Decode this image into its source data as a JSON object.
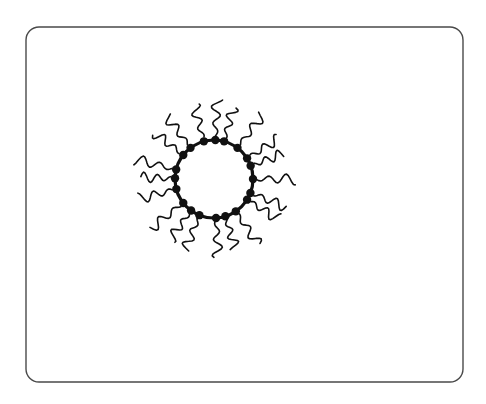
{
  "figure": {
    "kind": "scientific-line-diagram",
    "title": "",
    "caption": "",
    "background_color": "#ffffff",
    "ink_color": "#111111"
  },
  "frame": {
    "name": "rounded-rectangle-border",
    "x": 26,
    "y": 27,
    "width": 437,
    "height": 355,
    "corner_radius": 13,
    "stroke_color": "#4a4a4a",
    "stroke_width": 1.4,
    "fill": "#ffffff"
  },
  "micelle": {
    "center_x": 214,
    "center_y": 179,
    "core": {
      "name": "hydrophilic-core-ring",
      "radius": 39,
      "stroke_color": "#111111",
      "stroke_width": 3.2,
      "fill": "#ffffff"
    },
    "head_groups": {
      "name": "surfactant-head-group",
      "count": 20,
      "radius": 4.2,
      "orbit_radius": 39,
      "fill_color": "#111111",
      "shape": "filled-circle"
    },
    "tails": {
      "name": "surfactant-hydrocarbon-tail",
      "count": 20,
      "length": 33,
      "stroke_color": "#111111",
      "stroke_width": 1.6,
      "style": "wavy-radial",
      "wave_amplitude": 4.5,
      "wave_count": 2.2
    },
    "angles_deg": [
      0,
      18,
      36,
      54,
      72,
      90,
      108,
      126,
      144,
      162,
      180,
      198,
      216,
      234,
      252,
      270,
      288,
      306,
      324,
      342
    ],
    "tail_length_jitter": [
      3,
      -2,
      4,
      0,
      -3,
      5,
      1,
      -1,
      3,
      -4,
      2,
      0,
      -2,
      4,
      1,
      -3,
      5,
      -1,
      2,
      0
    ],
    "tail_angle_jitter_deg": [
      2,
      -3,
      1,
      4,
      -2,
      0,
      3,
      -4,
      2,
      1,
      -3,
      4,
      0,
      -2,
      3,
      1,
      -4,
      2,
      -1,
      3
    ]
  }
}
